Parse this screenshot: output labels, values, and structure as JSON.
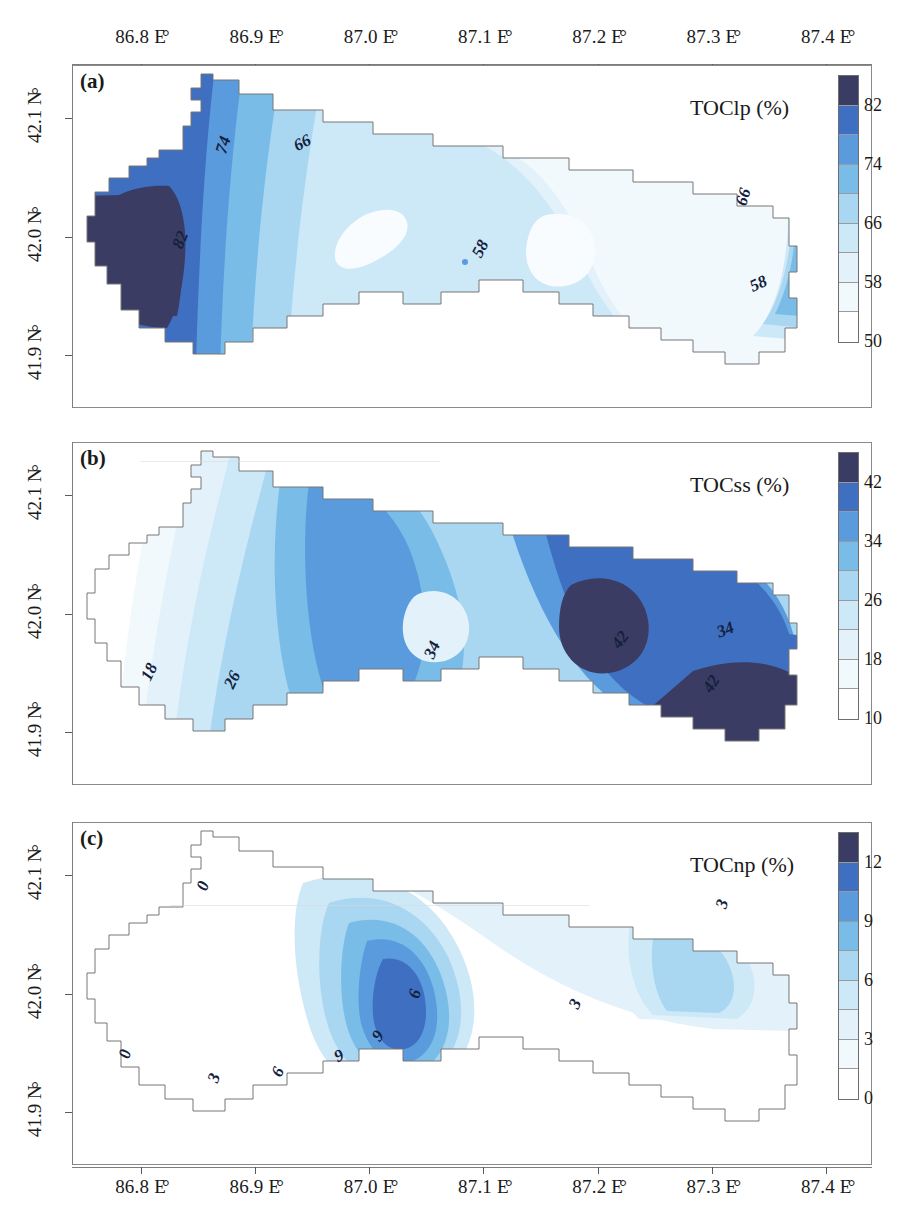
{
  "axes": {
    "x_ticks": [
      "86.8 E",
      "86.9 E",
      "87.0 E",
      "87.1 E",
      "87.2 E",
      "87.3 E",
      "87.4 E"
    ],
    "x_tick_values": [
      86.8,
      86.9,
      87.0,
      87.1,
      87.2,
      87.3,
      87.4
    ],
    "y_ticks": [
      "42.1 N",
      "42.0 N",
      "41.9 N"
    ],
    "y_tick_values": [
      42.1,
      42.0,
      41.9
    ],
    "degree_symbol": "°",
    "xlim": [
      86.74,
      87.44
    ],
    "ylim": [
      41.855,
      42.145
    ]
  },
  "panels": [
    {
      "tag": "(a)",
      "variable": "TOClp (%)",
      "colorbar_ticks": [
        "82",
        "74",
        "66",
        "58",
        "50"
      ],
      "colorbar_values": [
        82,
        74,
        66,
        58,
        50
      ],
      "contour_labels": [
        "74",
        "66",
        "58",
        "58",
        "66",
        "82"
      ]
    },
    {
      "tag": "(b)",
      "variable": "TOCss (%)",
      "colorbar_ticks": [
        "42",
        "34",
        "26",
        "18",
        "10"
      ],
      "colorbar_values": [
        42,
        34,
        26,
        18,
        10
      ],
      "contour_labels": [
        "18",
        "26",
        "34",
        "42",
        "34",
        "42"
      ]
    },
    {
      "tag": "(c)",
      "variable": "TOCnp (%)",
      "colorbar_ticks": [
        "12",
        "9",
        "6",
        "3",
        "0"
      ],
      "colorbar_values": [
        12,
        9,
        6,
        3,
        0
      ],
      "contour_labels": [
        "0",
        "0",
        "3",
        "6",
        "6",
        "9",
        "9",
        "3",
        "3"
      ]
    }
  ],
  "palette": {
    "b0": "#ffffff",
    "b1": "#f2f9fd",
    "b2": "#e2f1fa",
    "b3": "#cde8f7",
    "b4": "#a9d6f0",
    "b5": "#79bce8",
    "b6": "#5a9bdd",
    "b7": "#3f6fc0",
    "b8": "#3a3c63",
    "frame": "#8a8a8a",
    "contour_text": "#13213d"
  },
  "chart_data": {
    "type": "heatmap",
    "title": "",
    "xlabel": "Longitude (E)",
    "ylabel": "Latitude (N)",
    "subplots": [
      {
        "tag": "(a)",
        "name": "TOClp (%)",
        "levels": [
          50,
          54,
          58,
          62,
          66,
          70,
          74,
          78,
          82
        ],
        "cbar_range": [
          50,
          82
        ],
        "labeled_contours": [
          74,
          66,
          58,
          82
        ],
        "notes": "High values (>82%) in far west lobe; values decline eastward to 50-58% in the east"
      },
      {
        "tag": "(b)",
        "name": "TOCss (%)",
        "levels": [
          10,
          14,
          18,
          22,
          26,
          30,
          34,
          38,
          42
        ],
        "cbar_range": [
          10,
          42
        ],
        "labeled_contours": [
          18,
          26,
          34,
          42
        ],
        "notes": "Low values (10-18%) in the west; highest values (>42%) in the southeast corner"
      },
      {
        "tag": "(c)",
        "name": "TOCnp (%)",
        "levels": [
          0,
          1.5,
          3,
          4.5,
          6,
          7.5,
          9,
          10.5,
          12
        ],
        "cbar_range": [
          0,
          12
        ],
        "labeled_contours": [
          0,
          3,
          6,
          9
        ],
        "notes": "Near zero in the west; central maximum around 87.0 E / 42.0 N reaching 9-12%"
      }
    ]
  }
}
